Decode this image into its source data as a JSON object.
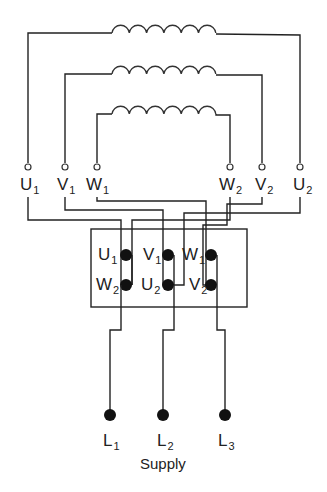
{
  "diagram": {
    "winding_terminals_top": [
      {
        "id": "U1",
        "letter": "U",
        "sub": "1",
        "x": 28
      },
      {
        "id": "V1",
        "letter": "V",
        "sub": "1",
        "x": 65
      },
      {
        "id": "W1",
        "letter": "W",
        "sub": "1",
        "x": 97
      },
      {
        "id": "W2",
        "letter": "W",
        "sub": "2",
        "x": 230
      },
      {
        "id": "V2",
        "letter": "V",
        "sub": "2",
        "x": 262
      },
      {
        "id": "U2",
        "letter": "U",
        "sub": "2",
        "x": 300
      }
    ],
    "terminal_box": {
      "top_row": [
        {
          "id": "U1",
          "letter": "U",
          "sub": "1"
        },
        {
          "id": "V1",
          "letter": "V",
          "sub": "1"
        },
        {
          "id": "W1",
          "letter": "W",
          "sub": "1"
        }
      ],
      "bottom_row": [
        {
          "id": "W2",
          "letter": "W",
          "sub": "2"
        },
        {
          "id": "U2",
          "letter": "U",
          "sub": "2"
        },
        {
          "id": "V2",
          "letter": "V",
          "sub": "2"
        }
      ]
    },
    "supply_lines": [
      {
        "id": "L1",
        "letter": "L",
        "sub": "1"
      },
      {
        "id": "L2",
        "letter": "L",
        "sub": "2"
      },
      {
        "id": "L3",
        "letter": "L",
        "sub": "3"
      }
    ],
    "caption": "Supply",
    "colors": {
      "line": "#222222",
      "background": "#ffffff"
    }
  }
}
